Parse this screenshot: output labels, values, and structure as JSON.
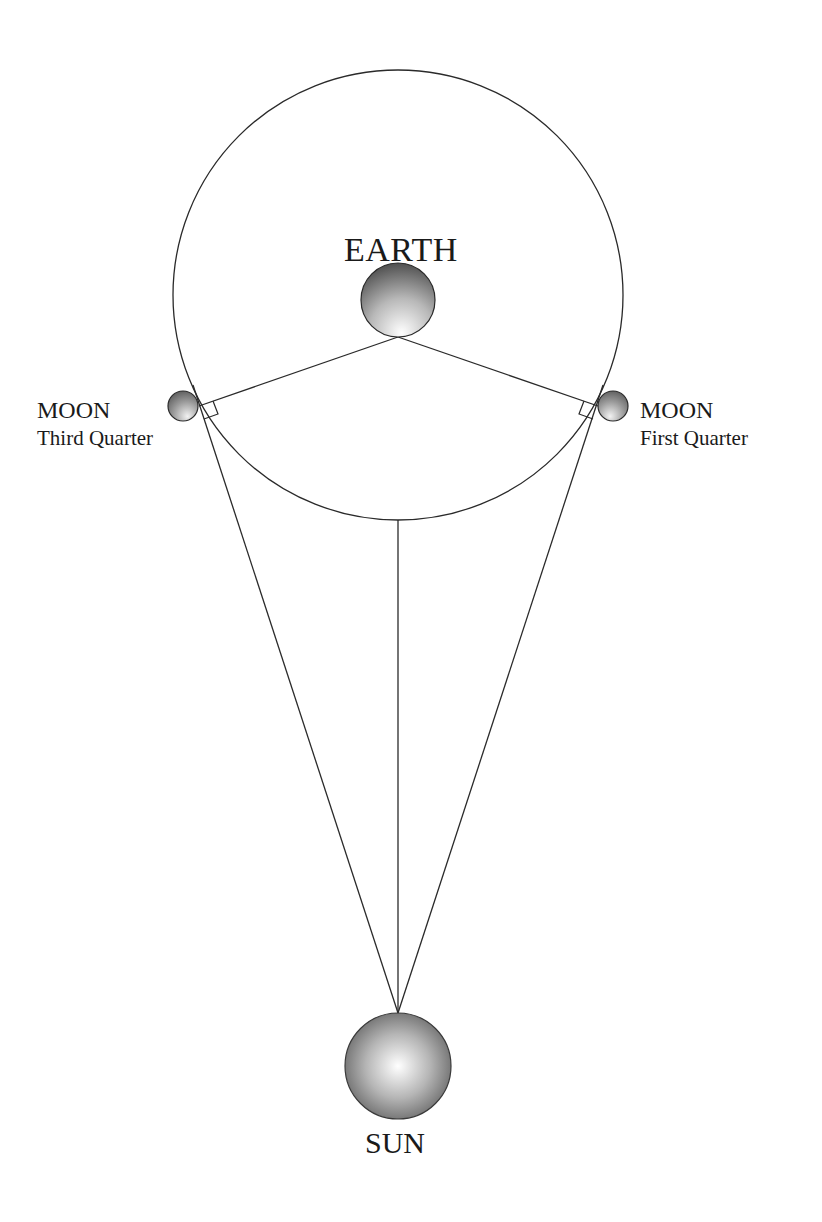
{
  "colors": {
    "line": "#2a2a2a",
    "text": "#1a1a1a",
    "sphere_dark": "#3a3a3a",
    "sphere_light": "#ffffff",
    "background": "#ffffff"
  },
  "orbit": {
    "cx": 398,
    "cy": 295,
    "r": 225
  },
  "earth": {
    "label": "EARTH",
    "cx": 398,
    "cy": 300,
    "r": 37,
    "label_x": 344,
    "label_y": 232
  },
  "moon_third_quarter": {
    "name": "MOON",
    "phase": "Third Quarter",
    "cx": 183,
    "cy": 406,
    "r": 15
  },
  "moon_first_quarter": {
    "name": "MOON",
    "phase": "First Quarter",
    "cx": 613,
    "cy": 406,
    "r": 15
  },
  "sun": {
    "label": "SUN",
    "cx": 398,
    "cy": 1066,
    "r": 53
  },
  "lines": {
    "earth_point": {
      "x": 398,
      "y": 337
    },
    "sun_point": {
      "x": 398,
      "y": 1013
    },
    "moon_left_tangent": {
      "x": 199,
      "y": 406
    },
    "moon_right_tangent": {
      "x": 598,
      "y": 406
    },
    "orbit_bottom": {
      "x": 398,
      "y": 520
    }
  }
}
